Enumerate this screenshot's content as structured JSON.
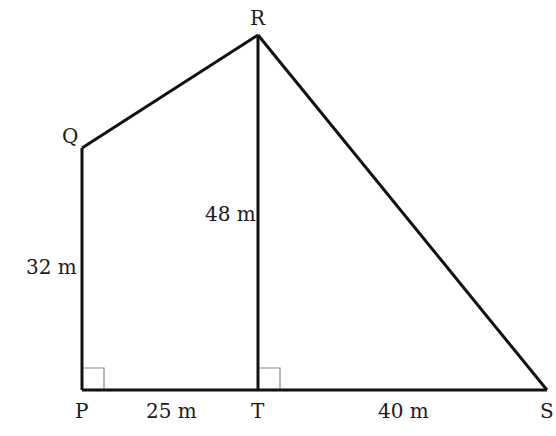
{
  "diagram": {
    "vertices": {
      "P": {
        "label": "P",
        "x": 82,
        "y": 390
      },
      "Q": {
        "label": "Q",
        "x": 82,
        "y": 148
      },
      "R": {
        "label": "R",
        "x": 258,
        "y": 35
      },
      "S": {
        "label": "S",
        "x": 547,
        "y": 390
      },
      "T": {
        "label": "T",
        "x": 258,
        "y": 390
      }
    },
    "measurements": {
      "PQ": "32 m",
      "RT": "48 m",
      "PT": "25 m",
      "TS": "40 m"
    },
    "right_angles": [
      "P",
      "T"
    ],
    "colors": {
      "line": "#111111",
      "right_angle_mark": "#888888"
    }
  }
}
